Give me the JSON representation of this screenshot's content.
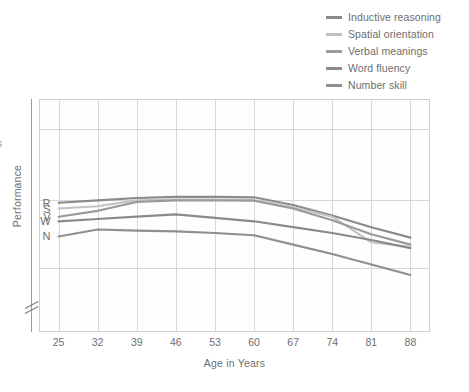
{
  "legend": {
    "position": "top-right",
    "items": [
      {
        "label": "Inductive reasoning",
        "color": "#8a8a8a",
        "key": "R"
      },
      {
        "label": "Spatial orientation",
        "color": "#c2c2c2",
        "key": "S"
      },
      {
        "label": "Verbal meanings",
        "color": "#9a9a9a",
        "key": "V"
      },
      {
        "label": "Word fluency",
        "color": "#8a8a8a",
        "key": "W"
      },
      {
        "label": "Number skill",
        "color": "#8f8f8f",
        "key": "N"
      }
    ]
  },
  "axes": {
    "xlabel": "Age in Years",
    "ylabel": "Performance",
    "xticks": [
      "25",
      "32",
      "39",
      "46",
      "53",
      "60",
      "67",
      "74",
      "81",
      "88"
    ],
    "y_axis_break": true,
    "y_tick_labels": []
  },
  "series_letters": [
    {
      "letter": "R"
    },
    {
      "letter": "S"
    },
    {
      "letter": "V"
    },
    {
      "letter": "W"
    },
    {
      "letter": "N"
    }
  ],
  "edge_fragment": "s",
  "colors": {
    "grid": "#d8d8d8",
    "frame": "#cfcfcf",
    "axis": "#9a9a9a",
    "text": "#6e6e6e",
    "background": "#ffffff"
  },
  "chart_data": {
    "type": "line",
    "title": "",
    "xlabel": "Age in Years",
    "ylabel": "Performance",
    "x": [
      25,
      32,
      39,
      46,
      53,
      60,
      67,
      74,
      81,
      88
    ],
    "xlim": [
      21.5,
      91.5
    ],
    "ylim": [
      0,
      100
    ],
    "grid": true,
    "legend_position": "top-right",
    "series": [
      {
        "name": "Inductive reasoning",
        "key": "R",
        "color": "#8a8a8a",
        "values": [
          55.5,
          56.5,
          57.5,
          58.0,
          58.0,
          57.8,
          54.5,
          50.0,
          45.0,
          40.5
        ]
      },
      {
        "name": "Spatial orientation",
        "key": "S",
        "color": "#c2c2c2",
        "values": [
          53.0,
          54.0,
          56.5,
          56.8,
          56.8,
          56.6,
          53.5,
          49.5,
          38.5,
          36.5
        ]
      },
      {
        "name": "Verbal meanings",
        "key": "V",
        "color": "#9a9a9a",
        "values": [
          49.5,
          52.0,
          55.8,
          56.5,
          56.5,
          56.3,
          53.0,
          48.0,
          42.0,
          37.5
        ]
      },
      {
        "name": "Word fluency",
        "key": "W",
        "color": "#8a8a8a",
        "values": [
          47.5,
          48.5,
          49.5,
          50.5,
          49.0,
          47.5,
          45.0,
          42.5,
          39.5,
          36.0
        ]
      },
      {
        "name": "Number skill",
        "key": "N",
        "color": "#8f8f8f",
        "values": [
          41.0,
          44.0,
          43.5,
          43.2,
          42.5,
          41.5,
          37.5,
          33.5,
          29.0,
          24.5
        ]
      }
    ]
  }
}
